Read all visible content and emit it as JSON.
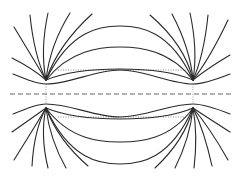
{
  "figure": {
    "title": "Field lines between two poles",
    "colors": {
      "line": "#2a2a2a",
      "axis": "#555555",
      "dotted": "#777777",
      "background": "#ffffff"
    },
    "poles": [
      {
        "name": "left-pole",
        "x": 46,
        "y": 94
      },
      {
        "name": "right-pole",
        "x": 193,
        "y": 94
      }
    ],
    "axis": {
      "y": 94,
      "x_start": 10,
      "x_end": 232,
      "style": "dashed"
    },
    "dotted_guides": [
      {
        "y": 70,
        "x_start": 58,
        "x_end": 186
      },
      {
        "y": 117,
        "x_start": 58,
        "x_end": 186
      }
    ]
  }
}
